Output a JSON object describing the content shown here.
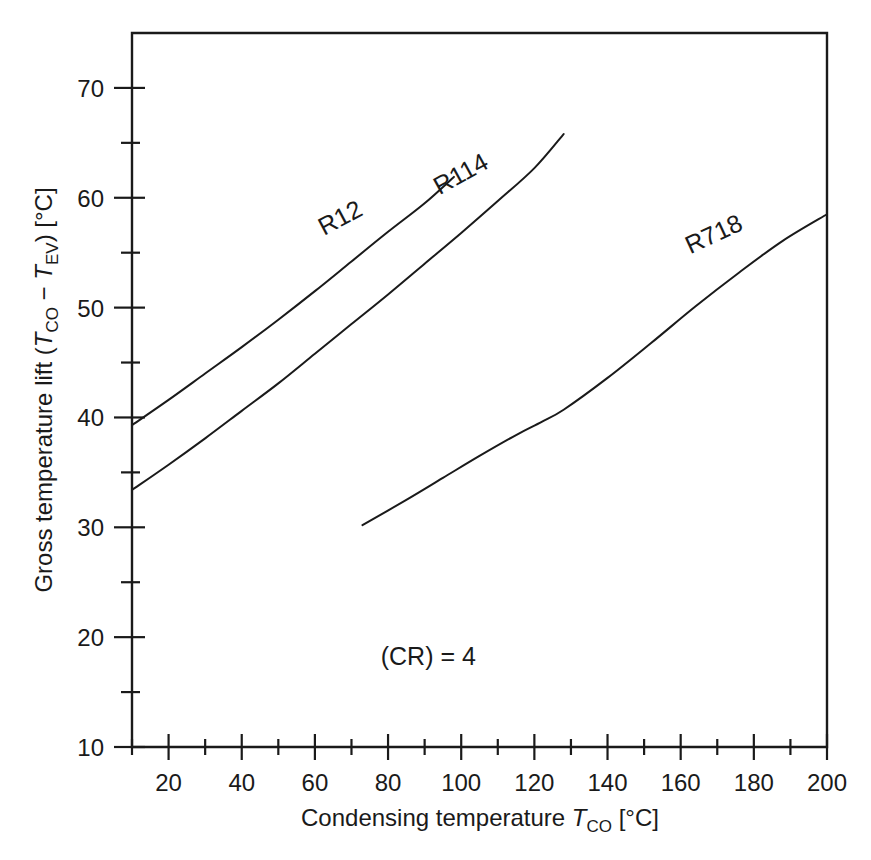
{
  "chart_data": {
    "type": "line",
    "title": "",
    "xlabel": "Condensing temperature T_CO [°C]",
    "ylabel": "Gross temperature lift (T_CO − T_EV) [°C]",
    "xlim": [
      10,
      200
    ],
    "ylim": [
      10,
      75
    ],
    "xticks": [
      20,
      40,
      60,
      80,
      100,
      120,
      140,
      160,
      180,
      200
    ],
    "xticklabels": [
      "20",
      "40",
      "60",
      "80",
      "100",
      "120",
      "140",
      "160",
      "180",
      "200"
    ],
    "xminorticks": [
      10,
      30,
      50,
      70,
      90,
      110,
      130,
      150,
      170,
      190
    ],
    "yticks": [
      10,
      20,
      30,
      40,
      50,
      60,
      70
    ],
    "yticklabels": [
      "10",
      "20",
      "30",
      "40",
      "50",
      "60",
      "70"
    ],
    "yminorticks": [
      15,
      25,
      35,
      45,
      55,
      65
    ],
    "grid": false,
    "legend": "inline-curve-labels",
    "annotations": [
      {
        "text": "(CR) = 4",
        "x": 78,
        "y": 17.5
      }
    ],
    "series": [
      {
        "name": "R12",
        "label": "R12",
        "label_x": 68,
        "label_y": 57.5,
        "label_rotation": -28,
        "points": [
          [
            10,
            39.3
          ],
          [
            20,
            41.6
          ],
          [
            30,
            44.0
          ],
          [
            40,
            46.4
          ],
          [
            50,
            48.9
          ],
          [
            60,
            51.5
          ],
          [
            70,
            54.2
          ],
          [
            80,
            56.9
          ],
          [
            90,
            59.5
          ],
          [
            98,
            61.9
          ]
        ]
      },
      {
        "name": "R114",
        "label": "R114",
        "label_x": 101,
        "label_y": 61.5,
        "label_rotation": -29,
        "points": [
          [
            10,
            33.4
          ],
          [
            20,
            35.7
          ],
          [
            30,
            38.1
          ],
          [
            40,
            40.6
          ],
          [
            50,
            43.1
          ],
          [
            60,
            45.8
          ],
          [
            70,
            48.5
          ],
          [
            80,
            51.2
          ],
          [
            90,
            54.0
          ],
          [
            100,
            56.8
          ],
          [
            110,
            59.7
          ],
          [
            120,
            62.7
          ],
          [
            128,
            65.8
          ]
        ]
      },
      {
        "name": "R718",
        "label": "R718",
        "label_x": 170,
        "label_y": 56.0,
        "label_rotation": -25,
        "points": [
          [
            73,
            30.2
          ],
          [
            85,
            32.5
          ],
          [
            95,
            34.5
          ],
          [
            105,
            36.5
          ],
          [
            115,
            38.4
          ],
          [
            122,
            39.6
          ],
          [
            128,
            40.7
          ],
          [
            140,
            43.6
          ],
          [
            152,
            46.8
          ],
          [
            164,
            50.1
          ],
          [
            176,
            53.2
          ],
          [
            188,
            56.1
          ],
          [
            200,
            58.5
          ]
        ]
      }
    ]
  },
  "axes": {
    "x_title_parts": {
      "main": "Condensing temperature ",
      "sym": "T",
      "sub": "CO",
      "unit": " [°C]"
    },
    "y_title_parts": {
      "p1": "Gross temperature lift (",
      "sym1": "T",
      "sub1": "CO",
      "minus": " − ",
      "sym2": "T",
      "sub2": "EV",
      "p2": ") [°C]"
    }
  },
  "colors": {
    "line": "#1a1a1a",
    "background": "#ffffff",
    "axis": "#1a1a1a"
  }
}
